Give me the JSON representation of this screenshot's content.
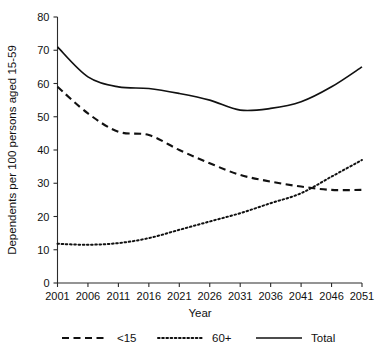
{
  "chart_data": {
    "type": "line",
    "title": "",
    "xlabel": "Year",
    "ylabel": "Dependents per 100 persons aged 15-59",
    "x": [
      2001,
      2006,
      2011,
      2016,
      2021,
      2026,
      2031,
      2036,
      2041,
      2046,
      2051
    ],
    "categories": [
      "2001",
      "2006",
      "2011",
      "2016",
      "2021",
      "2026",
      "2031",
      "2036",
      "2041",
      "2046",
      "2051"
    ],
    "xlim": [
      2001,
      2051
    ],
    "ylim": [
      0,
      80
    ],
    "yticks": [
      0,
      10,
      20,
      30,
      40,
      50,
      60,
      70,
      80
    ],
    "ytick_labels": [
      "0",
      "10",
      "20",
      "30",
      "40",
      "50",
      "60",
      "70",
      "80"
    ],
    "xtick_labels": [
      "2001",
      "2006",
      "2011",
      "2016",
      "2021",
      "2026",
      "2031",
      "2036",
      "2041",
      "2046",
      "2051"
    ],
    "grid": false,
    "legend_position": "bottom",
    "series": [
      {
        "name": "<15",
        "style": "dashed",
        "color": "#111111",
        "values": [
          59,
          51,
          45.5,
          44.5,
          40,
          36,
          32.5,
          30.5,
          29,
          28,
          28
        ]
      },
      {
        "name": "60+",
        "style": "dotted",
        "color": "#111111",
        "values": [
          11.8,
          11.5,
          12,
          13.5,
          16,
          18.5,
          21,
          24,
          27,
          32,
          37
        ]
      },
      {
        "name": "Total",
        "style": "solid",
        "color": "#111111",
        "values": [
          71,
          62,
          59,
          58.5,
          57,
          55,
          52,
          52.5,
          54.5,
          59,
          65
        ]
      }
    ]
  },
  "axes": {
    "y_title": "Dependents per 100 persons aged 15-59",
    "x_title": "Year"
  },
  "legend": {
    "items": [
      {
        "label": "<15",
        "style": "dashed"
      },
      {
        "label": "60+",
        "style": "dotted"
      },
      {
        "label": "Total",
        "style": "solid"
      }
    ]
  }
}
